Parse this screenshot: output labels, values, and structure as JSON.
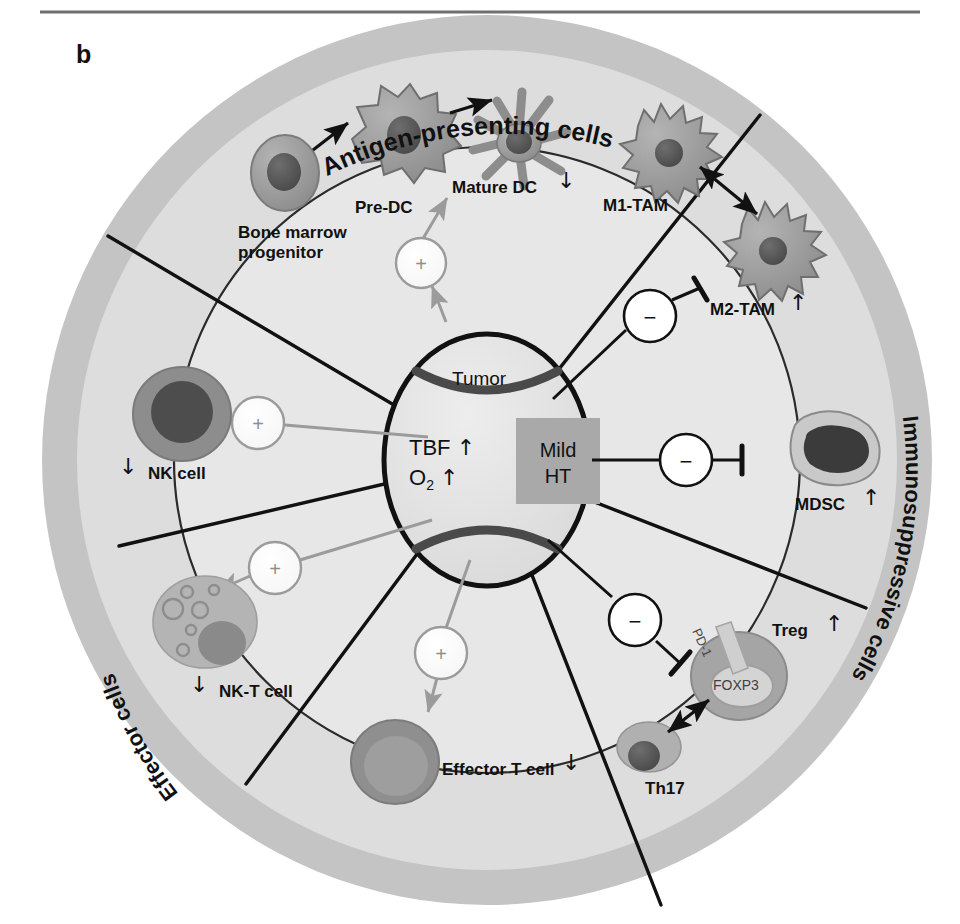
{
  "figure": {
    "panel_label": "b",
    "top_rule": true
  },
  "colors": {
    "outer_ring": "#c3c3c3",
    "mid_ring": "#dcdcdc",
    "inner_disc": "#e9e9e9",
    "core_disc": "#e4e4e4",
    "tumor_fill": "#e2e2e2",
    "tumor_stroke": "#111111",
    "mild_ht_box": "#a9a9a9",
    "cell_body": "#9a9a9a",
    "cell_nucleus": "#5d5d5d",
    "positive_stroke": "#9b9b9b",
    "negative_stroke": "#111111",
    "text": "#111111"
  },
  "ring_labels": [
    {
      "id": "antigen-presenting-cells",
      "text": "Antigen-presenting cells"
    },
    {
      "id": "immunosuppressive-cells",
      "text": "Immunosuppressive cells"
    },
    {
      "id": "effector-cells",
      "text": "Effector cells"
    }
  ],
  "center": {
    "tumor_label": "Tumor",
    "tbf_label": "TBF",
    "tbf_arrow": "↑",
    "o2_label": "O",
    "o2_subscript": "2",
    "o2_arrow": "↑",
    "mild_ht_line1": "Mild",
    "mild_ht_line2": "HT"
  },
  "cells": [
    {
      "id": "bone-marrow-progenitor",
      "label": "Bone marrow\nprogenitor",
      "line1": "Bone marrow",
      "line2": "progenitor",
      "trend": ""
    },
    {
      "id": "pre-dc",
      "label": "Pre-DC",
      "trend": ""
    },
    {
      "id": "mature-dc",
      "label": "Mature DC",
      "trend": "↓"
    },
    {
      "id": "m1-tam",
      "label": "M1-TAM",
      "trend": ""
    },
    {
      "id": "m2-tam",
      "label": "M2-TAM",
      "trend": "↑"
    },
    {
      "id": "mdsc",
      "label": "MDSC",
      "trend": "↑"
    },
    {
      "id": "treg",
      "label": "Treg",
      "trend": "↑",
      "marker_pd1": "PD-1",
      "marker_foxp3": "FOXP3"
    },
    {
      "id": "th17",
      "label": "Th17",
      "trend": ""
    },
    {
      "id": "effector-t-cell",
      "label": "Effector T cell",
      "trend": "↓"
    },
    {
      "id": "nk-t-cell",
      "label": "NK-T cell",
      "trend": "↓"
    },
    {
      "id": "nk-cell",
      "label": "NK cell",
      "trend": "↓"
    }
  ],
  "signal_nodes": [
    {
      "id": "plus-apc",
      "sign": "+",
      "kind": "stimulate"
    },
    {
      "id": "plus-nk",
      "sign": "+",
      "kind": "stimulate"
    },
    {
      "id": "plus-nkt",
      "sign": "+",
      "kind": "stimulate"
    },
    {
      "id": "plus-teff",
      "sign": "+",
      "kind": "stimulate"
    },
    {
      "id": "minus-tam",
      "sign": "−",
      "kind": "inhibit"
    },
    {
      "id": "minus-mdsc",
      "sign": "−",
      "kind": "inhibit"
    },
    {
      "id": "minus-treg",
      "sign": "−",
      "kind": "inhibit"
    }
  ]
}
